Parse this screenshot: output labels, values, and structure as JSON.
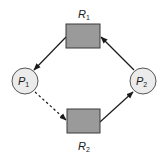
{
  "diagram": {
    "type": "resource-allocation-graph",
    "colors": {
      "resource_fill": "#9a9a9a",
      "resource_stroke": "#3a3a3a",
      "process_fill": "#ebebeb",
      "process_stroke": "#555555",
      "edge": "#1a1a1a"
    },
    "resources": [
      {
        "id": "R1",
        "letter": "R",
        "subscript": "1"
      },
      {
        "id": "R2",
        "letter": "R",
        "subscript": "2"
      }
    ],
    "processes": [
      {
        "id": "P1",
        "letter": "P",
        "subscript": "1"
      },
      {
        "id": "P2",
        "letter": "P",
        "subscript": "2"
      }
    ],
    "edges": [
      {
        "from": "R1",
        "to": "P1",
        "kind": "assignment",
        "style": "solid"
      },
      {
        "from": "P1",
        "to": "R2",
        "kind": "claim",
        "style": "dashed"
      },
      {
        "from": "R2",
        "to": "P2",
        "kind": "assignment",
        "style": "solid"
      },
      {
        "from": "P2",
        "to": "R1",
        "kind": "request",
        "style": "solid"
      }
    ]
  }
}
